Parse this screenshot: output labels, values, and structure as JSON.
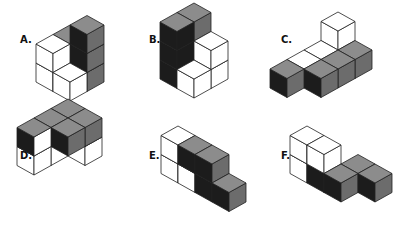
{
  "colors": {
    "w": "#ffffff",
    "d": "#1c1c1c",
    "g": "#8c8c8c",
    "m": "#6c6c6c",
    "stroke": "#222222"
  },
  "cube": {
    "dx": 17,
    "dy": 9.5,
    "h": 19
  },
  "figures": [
    {
      "label": "A.",
      "label_x": 20,
      "label_y": 34,
      "origin": [
        70,
        63
      ],
      "cubes": [
        {
          "p": [
            0,
            0,
            0
          ],
          "l": "g",
          "r": "g",
          "t": "g"
        },
        {
          "p": [
            0,
            0,
            1
          ],
          "l": "g",
          "r": "g",
          "t": "g"
        },
        {
          "p": [
            1,
            0,
            0
          ],
          "l": "d",
          "r": "m",
          "t": "g"
        },
        {
          "p": [
            1,
            0,
            1
          ],
          "l": "d",
          "r": "m",
          "t": "g"
        },
        {
          "p": [
            1,
            0,
            2
          ],
          "l": "d",
          "r": "m",
          "t": "g"
        },
        {
          "p": [
            0,
            1,
            0
          ],
          "l": "w",
          "r": "w",
          "t": "w"
        },
        {
          "p": [
            0,
            1,
            1
          ],
          "l": "w",
          "r": "w",
          "t": "w"
        },
        {
          "p": [
            1,
            1,
            0
          ],
          "l": "w",
          "r": "w",
          "t": "w"
        }
      ]
    },
    {
      "label": "B.",
      "label_x": 149,
      "label_y": 34,
      "origin": [
        194,
        60
      ],
      "cubes": [
        {
          "p": [
            0,
            0,
            0
          ],
          "l": "d",
          "r": "m",
          "t": "g"
        },
        {
          "p": [
            0,
            0,
            1
          ],
          "l": "d",
          "r": "m",
          "t": "g"
        },
        {
          "p": [
            0,
            0,
            2
          ],
          "l": "d",
          "r": "m",
          "t": "g"
        },
        {
          "p": [
            0,
            1,
            0
          ],
          "l": "d",
          "r": "d",
          "t": "g"
        },
        {
          "p": [
            0,
            1,
            1
          ],
          "l": "d",
          "r": "d",
          "t": "g"
        },
        {
          "p": [
            0,
            1,
            2
          ],
          "l": "d",
          "r": "d",
          "t": "g"
        },
        {
          "p": [
            1,
            0,
            0
          ],
          "l": "w",
          "r": "w",
          "t": "w"
        },
        {
          "p": [
            1,
            0,
            1
          ],
          "l": "w",
          "r": "w",
          "t": "w"
        },
        {
          "p": [
            1,
            1,
            0
          ],
          "l": "w",
          "r": "w",
          "t": "w"
        }
      ]
    },
    {
      "label": "C.",
      "label_x": 281,
      "label_y": 34,
      "origin": [
        338,
        50
      ],
      "cubes": [
        {
          "p": [
            0,
            0,
            0
          ],
          "l": "w",
          "r": "w",
          "t": "w"
        },
        {
          "p": [
            0,
            0,
            1
          ],
          "l": "w",
          "r": "w",
          "t": "w"
        },
        {
          "p": [
            0,
            1,
            0
          ],
          "l": "w",
          "r": "w",
          "t": "w"
        },
        {
          "p": [
            0,
            2,
            0
          ],
          "l": "w",
          "r": "w",
          "t": "w"
        },
        {
          "p": [
            1,
            0,
            0
          ],
          "l": "d",
          "r": "m",
          "t": "g"
        },
        {
          "p": [
            1,
            1,
            0
          ],
          "l": "d",
          "r": "m",
          "t": "g"
        },
        {
          "p": [
            1,
            2,
            0
          ],
          "l": "d",
          "r": "m",
          "t": "g"
        },
        {
          "p": [
            0,
            3,
            0
          ],
          "l": "d",
          "r": "m",
          "t": "g"
        }
      ]
    },
    {
      "label": "D.",
      "label_x": 20,
      "label_y": 150,
      "origin": [
        68,
        137
      ],
      "cubes": [
        {
          "p": [
            0,
            0,
            1
          ],
          "l": "d",
          "r": "m",
          "t": "g"
        },
        {
          "p": [
            1,
            0,
            1
          ],
          "l": "d",
          "r": "m",
          "t": "g"
        },
        {
          "p": [
            1,
            0,
            0
          ],
          "l": "w",
          "r": "w",
          "t": "w"
        },
        {
          "p": [
            0,
            1,
            1
          ],
          "l": "d",
          "r": "m",
          "t": "g"
        },
        {
          "p": [
            1,
            1,
            1
          ],
          "l": "d",
          "r": "m",
          "t": "g"
        },
        {
          "p": [
            0,
            1,
            0
          ],
          "l": "w",
          "r": "w",
          "t": "w"
        },
        {
          "p": [
            0,
            2,
            0
          ],
          "l": "w",
          "r": "w",
          "t": "w"
        },
        {
          "p": [
            0,
            2,
            1
          ],
          "l": "d",
          "r": "w",
          "t": "g"
        }
      ]
    },
    {
      "label": "E.",
      "label_x": 149,
      "label_y": 150,
      "origin": [
        178,
        164
      ],
      "cubes": [
        {
          "p": [
            0,
            0,
            0
          ],
          "l": "w",
          "r": "w",
          "t": "w"
        },
        {
          "p": [
            0,
            0,
            1
          ],
          "l": "w",
          "r": "w",
          "t": "w"
        },
        {
          "p": [
            1,
            0,
            0
          ],
          "l": "w",
          "r": "w",
          "t": "w"
        },
        {
          "p": [
            1,
            0,
            1
          ],
          "l": "d",
          "r": "m",
          "t": "g"
        },
        {
          "p": [
            2,
            0,
            0
          ],
          "l": "d",
          "r": "m",
          "t": "g"
        },
        {
          "p": [
            2,
            0,
            1
          ],
          "l": "d",
          "r": "m",
          "t": "g"
        },
        {
          "p": [
            3,
            0,
            0
          ],
          "l": "d",
          "r": "m",
          "t": "g"
        }
      ]
    },
    {
      "label": "F.",
      "label_x": 281,
      "label_y": 150,
      "origin": [
        307,
        164
      ],
      "cubes": [
        {
          "p": [
            0,
            0,
            0
          ],
          "l": "w",
          "r": "w",
          "t": "w"
        },
        {
          "p": [
            0,
            0,
            1
          ],
          "l": "w",
          "r": "w",
          "t": "w"
        },
        {
          "p": [
            1,
            0,
            0
          ],
          "l": "d",
          "r": "m",
          "t": "g"
        },
        {
          "p": [
            1,
            0,
            1
          ],
          "l": "w",
          "r": "w",
          "t": "w"
        },
        {
          "p": [
            2,
            0,
            0
          ],
          "l": "d",
          "r": "m",
          "t": "g"
        },
        {
          "p": [
            2,
            -1,
            0
          ],
          "l": "d",
          "r": "m",
          "t": "g"
        },
        {
          "p": [
            3,
            -1,
            0
          ],
          "l": "d",
          "r": "m",
          "t": "g"
        }
      ]
    }
  ]
}
